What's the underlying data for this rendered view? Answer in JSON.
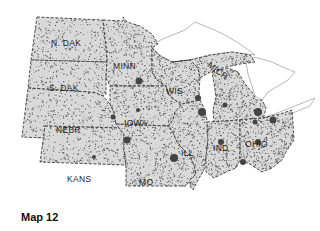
{
  "map": {
    "caption": "Map 12",
    "colors": {
      "land": "#d9d9d9",
      "border": "#3a3a3a",
      "water": "#ffffff",
      "dots": "#555555"
    },
    "states": [
      {
        "id": "nd",
        "label": "N. DAK"
      },
      {
        "id": "sd",
        "label": "S. DAK"
      },
      {
        "id": "nebr",
        "label": "NEBR"
      },
      {
        "id": "kans",
        "label": "KANS"
      },
      {
        "id": "minn",
        "label": "MINN"
      },
      {
        "id": "iowa",
        "label": "IOWA"
      },
      {
        "id": "mo",
        "label": "MO"
      },
      {
        "id": "wis",
        "label": "WIS"
      },
      {
        "id": "ill",
        "label": "ILL"
      },
      {
        "id": "mich",
        "label": "MICH"
      },
      {
        "id": "ind",
        "label": "IND"
      },
      {
        "id": "ohio",
        "label": "OHIO"
      }
    ]
  }
}
